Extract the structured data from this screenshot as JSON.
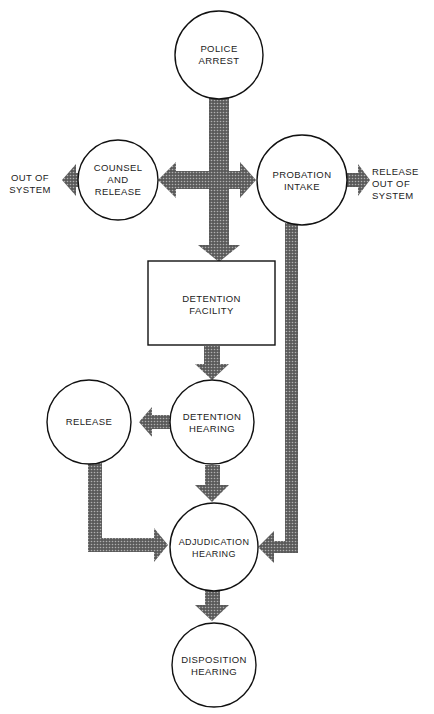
{
  "diagram": {
    "type": "flowchart",
    "colors": {
      "arrow_fill": "#4a4a4a",
      "arrow_pattern_light": "#9a9a9a",
      "node_stroke": "#111111",
      "background": "#ffffff"
    },
    "nodes": {
      "police_arrest": {
        "label": "POLICE\nARREST",
        "shape": "circle"
      },
      "counsel_and_release": {
        "label": "COUNSEL\nAND\nRELEASE",
        "shape": "circle"
      },
      "probation_intake": {
        "label": "PROBATION\nINTAKE",
        "shape": "circle"
      },
      "detention_facility": {
        "label": "DETENTION\nFACILITY",
        "shape": "rectangle"
      },
      "detention_hearing": {
        "label": "DETENTION\nHEARING",
        "shape": "circle"
      },
      "release": {
        "label": "RELEASE",
        "shape": "circle"
      },
      "adjudication_hearing": {
        "label": "ADJUDICATION\nHEARING",
        "shape": "circle"
      },
      "disposition_hearing": {
        "label": "DISPOSITION\nHEARING",
        "shape": "circle"
      }
    },
    "terminals": {
      "out_of_system": {
        "label": "OUT OF\nSYSTEM"
      },
      "release_out_of_system": {
        "label": "RELEASE\nOUT OF\nSYSTEM"
      }
    },
    "edges": [
      {
        "from": "Police Arrest",
        "to": "Detention Facility"
      },
      {
        "from": "Police Arrest",
        "to": "Counsel and Release"
      },
      {
        "from": "Police Arrest",
        "to": "Probation Intake"
      },
      {
        "from": "Counsel and Release",
        "to": "Out of System"
      },
      {
        "from": "Probation Intake",
        "to": "Release Out of System"
      },
      {
        "from": "Probation Intake",
        "to": "Adjudication Hearing"
      },
      {
        "from": "Detention Facility",
        "to": "Detention Hearing"
      },
      {
        "from": "Detention Hearing",
        "to": "Release"
      },
      {
        "from": "Detention Hearing",
        "to": "Adjudication Hearing"
      },
      {
        "from": "Release",
        "to": "Adjudication Hearing"
      },
      {
        "from": "Adjudication Hearing",
        "to": "Disposition Hearing"
      }
    ]
  }
}
